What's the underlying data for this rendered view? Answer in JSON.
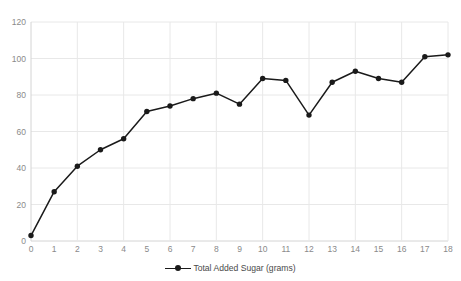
{
  "chart_data": {
    "type": "line",
    "title": "",
    "subtitle": "",
    "xlabel": "",
    "ylabel": "",
    "xlim": [
      0,
      18
    ],
    "ylim": [
      0,
      120
    ],
    "grid": true,
    "legend_position": "bottom",
    "x_ticks": [
      "0",
      "1",
      "2",
      "3",
      "4",
      "5",
      "6",
      "7",
      "8",
      "9",
      "10",
      "11",
      "12",
      "13",
      "14",
      "15",
      "16",
      "17",
      "18"
    ],
    "y_ticks": [
      "0",
      "20",
      "40",
      "60",
      "80",
      "100",
      "120"
    ],
    "x": [
      0,
      1,
      2,
      3,
      4,
      5,
      6,
      7,
      8,
      9,
      10,
      11,
      12,
      13,
      14,
      15,
      16,
      17,
      18
    ],
    "series": [
      {
        "name": "Total Added Sugar (grams)",
        "color": "#1a1a1a",
        "marker": "circle",
        "values": [
          3,
          27,
          41,
          50,
          56,
          71,
          74,
          78,
          81,
          75,
          89,
          88,
          69,
          87,
          93,
          89,
          87,
          101,
          102
        ]
      }
    ]
  },
  "legend": {
    "entries": [
      {
        "label": "Total Added Sugar (grams)",
        "marker": "line-dot-marker",
        "color": "#1a1a1a"
      }
    ]
  },
  "axis_colors": {
    "tick_label": "#8a8a8a",
    "gridline": "#e8e8e8",
    "axis_line": "#d4d4d4"
  }
}
